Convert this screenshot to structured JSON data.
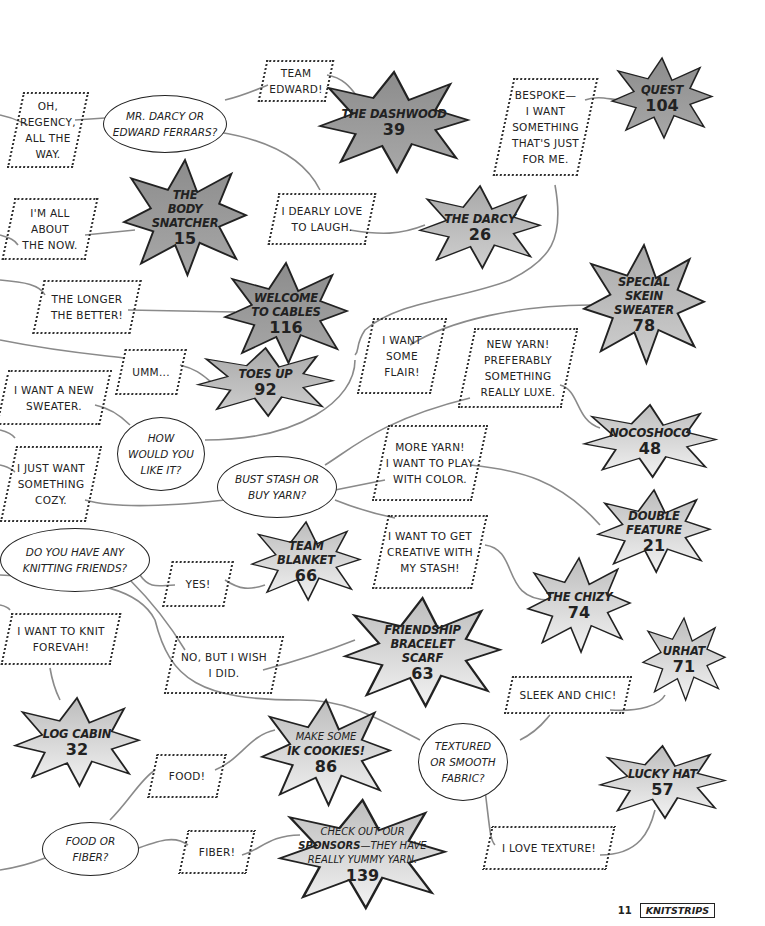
{
  "flowchart": {
    "questions": [
      {
        "id": "q1",
        "text": "Mr. Darcy or\nEdward Ferrars?"
      },
      {
        "id": "q2",
        "text": "How\nwould you\nlike it?"
      },
      {
        "id": "q3",
        "text": "Bust stash or\nbuy yarn?"
      },
      {
        "id": "q4",
        "text": "Do you have any\nknitting friends?"
      },
      {
        "id": "q5",
        "text": "Textured\nor smooth\nfabric?"
      },
      {
        "id": "q6",
        "text": "Food or\nfiber?"
      }
    ],
    "answers": [
      {
        "id": "a1",
        "text": "Oh,\nRegency,\nall the\nway."
      },
      {
        "id": "a2",
        "text": "Team\nEdward!"
      },
      {
        "id": "a3",
        "text": "Bespoke—\nI want\nsomething\nthat's just\nfor me."
      },
      {
        "id": "a4",
        "text": "I'm all\nabout\nthe now."
      },
      {
        "id": "a5",
        "text": "I dearly love\nto laugh."
      },
      {
        "id": "a6",
        "text": "The longer\nthe better!"
      },
      {
        "id": "a7",
        "text": "Umm..."
      },
      {
        "id": "a8",
        "text": "I want\nsome\nflair!"
      },
      {
        "id": "a9",
        "text": "New yarn!\npreferably\nsomething\nreally luxe."
      },
      {
        "id": "a10",
        "text": "I want a new\nsweater."
      },
      {
        "id": "a11",
        "text": "I just want\nsomething\ncozy."
      },
      {
        "id": "a12",
        "text": "More yarn!\nI want to play\nwith color."
      },
      {
        "id": "a13",
        "text": "I want to get\ncreative with\nmy stash!"
      },
      {
        "id": "a14",
        "text": "Yes!"
      },
      {
        "id": "a15",
        "text": "I want to knit\nforevah!"
      },
      {
        "id": "a16",
        "text": "No, but I wish\nI did."
      },
      {
        "id": "a17",
        "text": "Sleek and chic!"
      },
      {
        "id": "a18",
        "text": "Food!"
      },
      {
        "id": "a19",
        "text": "Fiber!"
      },
      {
        "id": "a20",
        "text": "I love texture!"
      }
    ],
    "results": [
      {
        "id": "r1",
        "name": "The Dashwood",
        "page": "39"
      },
      {
        "id": "r2",
        "name": "Quest",
        "page": "104"
      },
      {
        "id": "r3",
        "name": "The\nBody\nSnatcher",
        "page": "15"
      },
      {
        "id": "r4",
        "name": "The Darcy",
        "page": "26"
      },
      {
        "id": "r5",
        "name": "Welcome\nto Cables",
        "page": "116"
      },
      {
        "id": "r6",
        "name": "Special\nSkein\nSweater",
        "page": "78"
      },
      {
        "id": "r7",
        "name": "Toes Up",
        "page": "92"
      },
      {
        "id": "r8",
        "name": "Nocoshoco",
        "page": "48"
      },
      {
        "id": "r9",
        "name": "Double\nFeature",
        "page": "21"
      },
      {
        "id": "r10",
        "name": "Team\nBlanket",
        "page": "66"
      },
      {
        "id": "r11",
        "name": "The Chizy",
        "page": "74"
      },
      {
        "id": "r12",
        "name": "Friendship\nBracelet\nScarf",
        "page": "63"
      },
      {
        "id": "r13",
        "name": "Urhat",
        "page": "71"
      },
      {
        "id": "r14",
        "name": "Log Cabin",
        "page": "32"
      },
      {
        "id": "r15",
        "line1": "Make some",
        "bold": "IK Cookies",
        "suffix": "!",
        "page": "86"
      },
      {
        "id": "r16",
        "name": "Lucky Hat",
        "page": "57"
      },
      {
        "id": "r17",
        "line1": "Check out our",
        "bold": "Sponsors",
        "line2rest": "—they have",
        "line3": "really yummy yarn.",
        "page": "139"
      }
    ]
  },
  "footer": {
    "page_number": "11",
    "brand": "KNITSTRIPS"
  },
  "colors": {
    "dark_star": "#9a9a9a",
    "mid_star": "#b8b8b8",
    "light_star": "#dcdcdc",
    "line": "#8a8a8a",
    "ink": "#222222"
  }
}
